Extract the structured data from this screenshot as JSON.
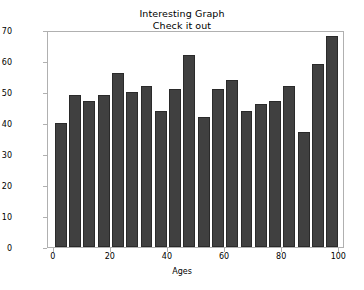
{
  "chart_data": {
    "type": "bar",
    "title": "Interesting Graph",
    "subtitle": "Check it out",
    "xlabel": "Ages",
    "ylabel": "Frequency",
    "xlim": [
      -2,
      102
    ],
    "ylim": [
      0,
      70
    ],
    "grid": false,
    "legend": null,
    "bar_color": "#404040",
    "bin_width": 5,
    "categories": [
      2.5,
      7.5,
      12.5,
      17.5,
      22.5,
      27.5,
      32.5,
      37.5,
      42.5,
      47.5,
      52.5,
      57.5,
      62.5,
      67.5,
      72.5,
      77.5,
      82.5,
      87.5,
      92.5,
      97.5
    ],
    "bin_edges": [
      0,
      5,
      10,
      15,
      20,
      25,
      30,
      35,
      40,
      45,
      50,
      55,
      60,
      65,
      70,
      75,
      80,
      85,
      90,
      95,
      100
    ],
    "values": [
      40,
      49,
      47,
      49,
      56,
      50,
      52,
      44,
      51,
      62,
      42,
      51,
      54,
      44,
      46,
      47,
      52,
      37,
      59,
      68
    ],
    "xticks": [
      0,
      20,
      40,
      60,
      80,
      100
    ],
    "xtick_labels": [
      "0",
      "20",
      "40",
      "60",
      "80",
      "100"
    ],
    "yticks": [
      0,
      10,
      20,
      30,
      40,
      50,
      60,
      70
    ],
    "ytick_labels": [
      "0",
      "10",
      "20",
      "30",
      "40",
      "50",
      "60",
      "70"
    ]
  }
}
